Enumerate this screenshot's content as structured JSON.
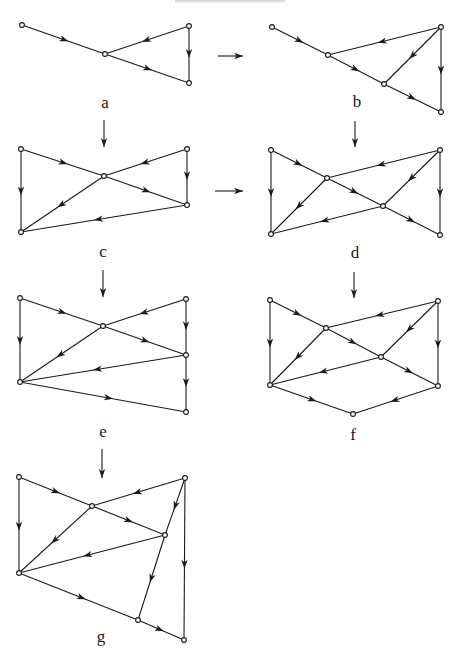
{
  "header": {
    "text_visible": false
  },
  "colors": {
    "ink": "#1a1a1a",
    "background": "#ffffff"
  },
  "diagrams": [
    {
      "id": "a",
      "label": "a",
      "label_pos": [
        105,
        108
      ],
      "nodes": [
        [
          22,
          25
        ],
        [
          105,
          54
        ],
        [
          189,
          26
        ],
        [
          189,
          83
        ]
      ],
      "edges": [
        [
          0,
          1
        ],
        [
          2,
          1
        ],
        [
          1,
          3
        ],
        [
          2,
          3
        ]
      ]
    },
    {
      "id": "b",
      "label": "b",
      "label_pos": [
        357,
        107
      ],
      "nodes": [
        [
          272,
          27
        ],
        [
          328,
          55
        ],
        [
          384,
          84
        ],
        [
          441,
          27
        ],
        [
          441,
          112
        ]
      ],
      "edges": [
        [
          0,
          1
        ],
        [
          1,
          2
        ],
        [
          2,
          4
        ],
        [
          3,
          1
        ],
        [
          3,
          2
        ],
        [
          3,
          4
        ]
      ]
    },
    {
      "id": "c",
      "label": "c",
      "label_pos": [
        103,
        257
      ],
      "nodes": [
        [
          21,
          149
        ],
        [
          104,
          176
        ],
        [
          187,
          149
        ],
        [
          187,
          205
        ],
        [
          21,
          232
        ]
      ],
      "edges": [
        [
          0,
          1
        ],
        [
          2,
          1
        ],
        [
          1,
          3
        ],
        [
          2,
          3
        ],
        [
          0,
          4
        ],
        [
          1,
          4
        ],
        [
          3,
          4
        ]
      ]
    },
    {
      "id": "d",
      "label": "d",
      "label_pos": [
        355,
        258
      ],
      "nodes": [
        [
          271,
          150
        ],
        [
          327,
          178
        ],
        [
          383,
          206
        ],
        [
          440,
          150
        ],
        [
          271,
          234
        ],
        [
          440,
          235
        ]
      ],
      "edges": [
        [
          0,
          1
        ],
        [
          3,
          1
        ],
        [
          1,
          2
        ],
        [
          3,
          2
        ],
        [
          2,
          5
        ],
        [
          3,
          5
        ],
        [
          0,
          4
        ],
        [
          1,
          4
        ],
        [
          2,
          4
        ]
      ]
    },
    {
      "id": "e",
      "label": "e",
      "label_pos": [
        103,
        437
      ],
      "nodes": [
        [
          20,
          298
        ],
        [
          103,
          326
        ],
        [
          186,
          299
        ],
        [
          186,
          355
        ],
        [
          20,
          382
        ],
        [
          186,
          412
        ]
      ],
      "edges": [
        [
          0,
          1
        ],
        [
          2,
          1
        ],
        [
          1,
          3
        ],
        [
          2,
          3
        ],
        [
          0,
          4
        ],
        [
          1,
          4
        ],
        [
          3,
          4
        ],
        [
          3,
          5
        ],
        [
          4,
          5
        ]
      ]
    },
    {
      "id": "f",
      "label": "f",
      "label_pos": [
        353,
        440
      ],
      "nodes": [
        [
          270,
          300
        ],
        [
          326,
          328
        ],
        [
          381,
          357
        ],
        [
          438,
          301
        ],
        [
          270,
          385
        ],
        [
          438,
          386
        ],
        [
          353,
          414
        ]
      ],
      "edges": [
        [
          0,
          1
        ],
        [
          3,
          1
        ],
        [
          1,
          2
        ],
        [
          3,
          2
        ],
        [
          2,
          5
        ],
        [
          3,
          5
        ],
        [
          0,
          4
        ],
        [
          1,
          4
        ],
        [
          2,
          4
        ],
        [
          4,
          6
        ],
        [
          5,
          6
        ]
      ]
    },
    {
      "id": "g",
      "label": "g",
      "label_pos": [
        101,
        642
      ],
      "nodes": [
        [
          19,
          477
        ],
        [
          92,
          506
        ],
        [
          185,
          478
        ],
        [
          165,
          535
        ],
        [
          19,
          573
        ],
        [
          138,
          620
        ],
        [
          184,
          640
        ]
      ],
      "edges": [
        [
          0,
          1
        ],
        [
          2,
          1
        ],
        [
          1,
          3
        ],
        [
          2,
          3
        ],
        [
          0,
          4
        ],
        [
          1,
          4
        ],
        [
          3,
          4
        ],
        [
          4,
          5
        ],
        [
          3,
          5
        ],
        [
          5,
          6
        ],
        [
          2,
          6
        ]
      ]
    }
  ],
  "transitions": [
    {
      "from": "a",
      "to": "b",
      "start": [
        218,
        56
      ],
      "end": [
        243,
        56
      ]
    },
    {
      "from": "a",
      "to": "c",
      "start": [
        104,
        120
      ],
      "end": [
        104,
        147
      ]
    },
    {
      "from": "b",
      "to": "d",
      "start": [
        355,
        121
      ],
      "end": [
        355,
        147
      ]
    },
    {
      "from": "c",
      "to": "d",
      "start": [
        215,
        191
      ],
      "end": [
        243,
        191
      ]
    },
    {
      "from": "c",
      "to": "e",
      "start": [
        103,
        270
      ],
      "end": [
        103,
        297
      ]
    },
    {
      "from": "d",
      "to": "f",
      "start": [
        354,
        272
      ],
      "end": [
        354,
        298
      ]
    },
    {
      "from": "e",
      "to": "g",
      "start": [
        102,
        449
      ],
      "end": [
        102,
        478
      ]
    }
  ]
}
